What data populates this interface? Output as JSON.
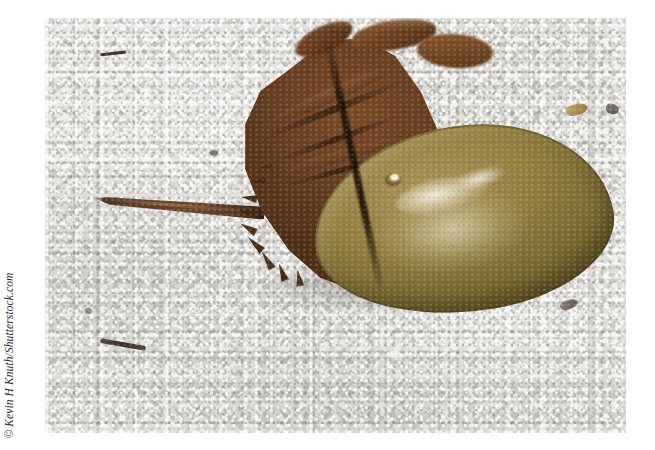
{
  "figure": {
    "domain": "natural-image",
    "background_color": "#ffffff"
  },
  "credit": {
    "text": "© Kevin H Knuth/Shutterstock.com",
    "symbol": "©",
    "photographer": "Kevin H Knuth",
    "agency": "Shutterstock.com",
    "color": "#2b2b2b",
    "orientation": "rotated-90-ccw"
  },
  "photo": {
    "x": 45,
    "y": 18,
    "width": 581,
    "height": 415,
    "scene": "beach sand",
    "colors": {
      "sand_light": "#f2f1ee",
      "sand_mid": "#d6d4cf",
      "sand_dark": "#bdbbb6",
      "carapace_olive": "#94803f",
      "carapace_highlight": "#fffff0",
      "abdomen_brown": "#693f20",
      "abdomen_dark": "#47290f",
      "telson_brown": "#5e3e29",
      "shadow": "#463e34"
    }
  },
  "subject_parts": [
    {
      "name": "prosoma",
      "common_name": "carapace dome",
      "color": "#94803f"
    },
    {
      "name": "opisthosoma",
      "common_name": "abdomen",
      "color": "#693f20"
    },
    {
      "name": "telson",
      "common_name": "tail spine",
      "color": "#5e3e29"
    },
    {
      "name": "compound-eye",
      "common_name": "eye",
      "color": "#8d7436"
    },
    {
      "name": "marginal-spines",
      "common_name": "spines",
      "color": "#4e2d16"
    }
  ],
  "sand_debris": [
    {
      "id": "twig",
      "x": 100,
      "y": 342,
      "w": 46,
      "h": 6,
      "color": "#4a3b30"
    },
    {
      "id": "dark-streak-top",
      "x": 100,
      "y": 52,
      "w": 26,
      "h": 4,
      "color": "#3f352c"
    },
    {
      "id": "shell-chip-upper-right",
      "x": 566,
      "y": 104,
      "w": 22,
      "h": 11,
      "color": "#b59763"
    },
    {
      "id": "dark-pebble-right",
      "x": 606,
      "y": 104,
      "w": 13,
      "h": 10,
      "color": "#6d655c"
    },
    {
      "id": "shell-chip-lower-right",
      "x": 560,
      "y": 300,
      "w": 18,
      "h": 9,
      "color": "#6a6258"
    },
    {
      "id": "shell-chip-bottom",
      "x": 390,
      "y": 352,
      "w": 12,
      "h": 8,
      "color": "#fbfaf7"
    },
    {
      "id": "dark-fleck-mid",
      "x": 210,
      "y": 150,
      "w": 9,
      "h": 7,
      "color": "#57504a"
    }
  ]
}
